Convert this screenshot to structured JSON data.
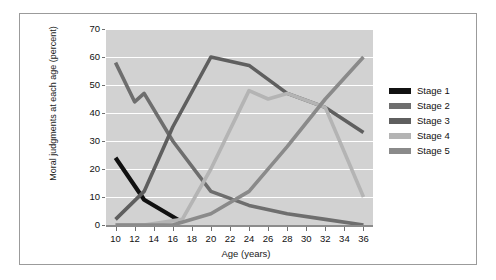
{
  "chart_data": {
    "type": "line",
    "title": "",
    "xlabel": "Age (years)",
    "ylabel": "Moral judgments at each age (percent)",
    "xlim": [
      9,
      37
    ],
    "ylim": [
      0,
      70
    ],
    "ytick_labels": [
      "0",
      "10",
      "20",
      "30",
      "40",
      "50",
      "60",
      "70"
    ],
    "ytick_values": [
      0,
      10,
      20,
      30,
      40,
      50,
      60,
      70
    ],
    "xtick_labels": [
      "10",
      "12",
      "14",
      "16",
      "18",
      "20",
      "22",
      "24",
      "26",
      "28",
      "30",
      "32",
      "34",
      "36"
    ],
    "xtick_values": [
      10,
      12,
      14,
      16,
      18,
      20,
      22,
      24,
      26,
      28,
      30,
      32,
      34,
      36
    ],
    "grid": "horizontal-white",
    "plot_background": "#d2d2d2",
    "legend_position": "right",
    "series": [
      {
        "name": "Stage 1",
        "color": "#111111",
        "x": [
          10,
          13,
          17
        ],
        "values": [
          24,
          9,
          1
        ]
      },
      {
        "name": "Stage 2",
        "color": "#6e6e6e",
        "x": [
          10,
          12,
          13,
          16,
          20,
          24,
          28,
          32,
          36
        ],
        "values": [
          58,
          44,
          47,
          30,
          12,
          7,
          4,
          2,
          0
        ]
      },
      {
        "name": "Stage 3",
        "color": "#5f5f5f",
        "x": [
          10,
          13,
          16,
          20,
          24,
          26,
          28,
          32,
          36
        ],
        "values": [
          2,
          12,
          35,
          60,
          57,
          52,
          47,
          42,
          33
        ]
      },
      {
        "name": "Stage 4",
        "color": "#b4b4b4",
        "x": [
          10,
          13,
          17,
          20,
          24,
          26,
          28,
          32,
          36
        ],
        "values": [
          0,
          0,
          2,
          20,
          48,
          45,
          47,
          42,
          10
        ]
      },
      {
        "name": "Stage 5",
        "color": "#8a8a8a",
        "x": [
          10,
          16,
          20,
          24,
          28,
          32,
          36
        ],
        "values": [
          0,
          0,
          4,
          12,
          28,
          45,
          60
        ]
      }
    ]
  },
  "legend": {
    "items": [
      {
        "label": "Stage 1",
        "color": "#111111"
      },
      {
        "label": "Stage 2",
        "color": "#6e6e6e"
      },
      {
        "label": "Stage 3",
        "color": "#5f5f5f"
      },
      {
        "label": "Stage 4",
        "color": "#b4b4b4"
      },
      {
        "label": "Stage 5",
        "color": "#8a8a8a"
      }
    ]
  }
}
